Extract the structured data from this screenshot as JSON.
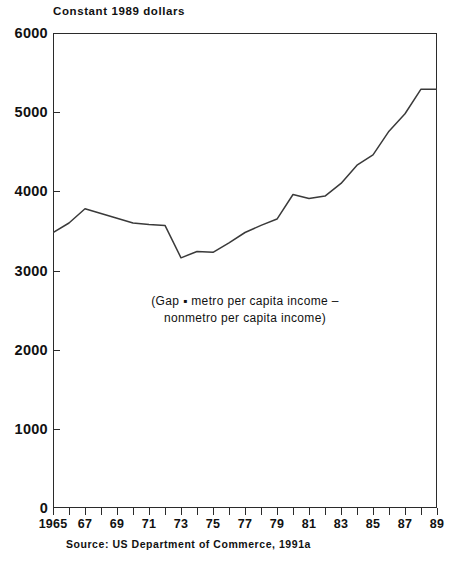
{
  "title": "Constant 1989 dollars",
  "source_note": "Source: US Department of Commerce, 1991a",
  "annotation": {
    "line1": "(Gap ▪ metro per capita income –",
    "line2": "nonmetro per capita income)"
  },
  "colors": {
    "axis": "#2b2b2b",
    "line": "#3a3a3a",
    "text": "#111111",
    "background": "#ffffff"
  },
  "axes": {
    "y_ticks": [
      0,
      1000,
      2000,
      3000,
      4000,
      5000,
      6000
    ],
    "y_tick_labels": [
      "0",
      "1000",
      "2000",
      "3000",
      "4000",
      "5000",
      "6000"
    ],
    "x_tick_years": [
      1965,
      1966,
      1967,
      1968,
      1969,
      1970,
      1971,
      1972,
      1973,
      1974,
      1975,
      1976,
      1977,
      1978,
      1979,
      1980,
      1981,
      1982,
      1983,
      1984,
      1985,
      1986,
      1987,
      1988,
      1989
    ],
    "x_tick_labels": [
      {
        "year": 1965,
        "label": "1965"
      },
      {
        "year": 1967,
        "label": "67"
      },
      {
        "year": 1969,
        "label": "69"
      },
      {
        "year": 1971,
        "label": "71"
      },
      {
        "year": 1973,
        "label": "73"
      },
      {
        "year": 1975,
        "label": "75"
      },
      {
        "year": 1977,
        "label": "77"
      },
      {
        "year": 1979,
        "label": "79"
      },
      {
        "year": 1981,
        "label": "81"
      },
      {
        "year": 1983,
        "label": "83"
      },
      {
        "year": 1985,
        "label": "85"
      },
      {
        "year": 1987,
        "label": "87"
      },
      {
        "year": 1989,
        "label": "89"
      }
    ]
  },
  "chart_data": {
    "type": "line",
    "title": "Constant 1989 dollars",
    "subtitle": "(Gap ▪ metro per capita income – nonmetro per capita income)",
    "xlabel": "",
    "ylabel": "Constant 1989 dollars",
    "xlim": [
      1965,
      1989
    ],
    "ylim": [
      0,
      6000
    ],
    "grid": false,
    "legend": "none",
    "x_tick_step": 2,
    "y_tick_step": 1000,
    "series": [
      {
        "name": "Metro minus nonmetro per capita income gap",
        "x": [
          1965,
          1966,
          1967,
          1968,
          1969,
          1970,
          1971,
          1972,
          1973,
          1974,
          1975,
          1976,
          1977,
          1978,
          1979,
          1980,
          1981,
          1982,
          1983,
          1984,
          1985,
          1986,
          1987,
          1988,
          1989
        ],
        "values": [
          3480,
          3600,
          3780,
          3720,
          3660,
          3600,
          3580,
          3570,
          3160,
          3240,
          3230,
          3350,
          3480,
          3570,
          3650,
          3960,
          3910,
          3940,
          4100,
          4330,
          4460,
          4760,
          4980,
          5290,
          5290
        ]
      }
    ],
    "annotations": [
      {
        "text": "(Gap ▪ metro per capita income – nonmetro per capita income)",
        "x": 1977,
        "y": 2450
      }
    ],
    "source": "Source: US Department of Commerce, 1991a"
  }
}
